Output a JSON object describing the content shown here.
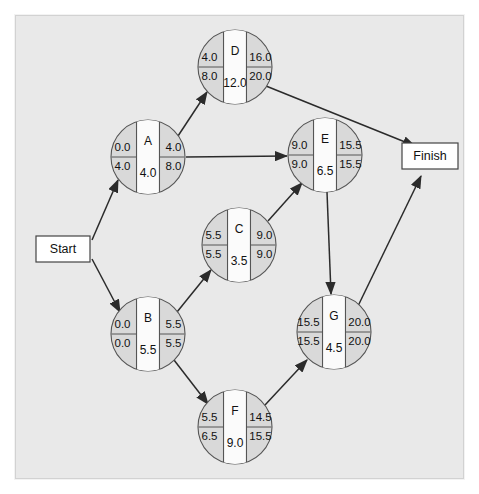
{
  "diagram": {
    "type": "activity-on-node-network",
    "title": "",
    "background_color": "#e9e9e9",
    "node_fill_color": "#d9d9d9",
    "node_band_color": "#fbfbfb",
    "edge_color": "#2b2b2b"
  },
  "terminals": [
    {
      "id": "start",
      "label": "Start",
      "x": 63,
      "y": 249,
      "w": 54,
      "h": 26
    },
    {
      "id": "finish",
      "label": "Finish",
      "x": 430,
      "y": 156,
      "w": 56,
      "h": 26
    }
  ],
  "nodes": [
    {
      "id": "D",
      "label": "D",
      "cx": 235,
      "cy": 67,
      "r": 37,
      "early_start": "4.0",
      "late_start": "8.0",
      "early_finish": "16.0",
      "late_finish": "20.0",
      "duration": "12.0"
    },
    {
      "id": "A",
      "label": "A",
      "cx": 148,
      "cy": 157,
      "r": 37,
      "early_start": "0.0",
      "late_start": "4.0",
      "early_finish": "4.0",
      "late_finish": "8.0",
      "duration": "4.0"
    },
    {
      "id": "E",
      "label": "E",
      "cx": 325,
      "cy": 155,
      "r": 37,
      "early_start": "9.0",
      "late_start": "9.0",
      "early_finish": "15.5",
      "late_finish": "15.5",
      "duration": "6.5"
    },
    {
      "id": "C",
      "label": "C",
      "cx": 239,
      "cy": 245,
      "r": 37,
      "early_start": "5.5",
      "late_start": "5.5",
      "early_finish": "9.0",
      "late_finish": "9.0",
      "duration": "3.5"
    },
    {
      "id": "B",
      "label": "B",
      "cx": 148,
      "cy": 334,
      "r": 37,
      "early_start": "0.0",
      "late_start": "0.0",
      "early_finish": "5.5",
      "late_finish": "5.5",
      "duration": "5.5"
    },
    {
      "id": "G",
      "label": "G",
      "cx": 334,
      "cy": 332,
      "r": 37,
      "early_start": "15.5",
      "late_start": "15.5",
      "early_finish": "20.0",
      "late_finish": "20.0",
      "duration": "4.5"
    },
    {
      "id": "F",
      "label": "F",
      "cx": 235,
      "cy": 427,
      "r": 37,
      "early_start": "5.5",
      "late_start": "6.5",
      "early_finish": "14.5",
      "late_finish": "15.5",
      "duration": "9.0"
    }
  ],
  "edges": [
    {
      "from": "start",
      "to": "A",
      "x1": 92,
      "y1": 240,
      "x2": 118,
      "y2": 180
    },
    {
      "from": "start",
      "to": "B",
      "x1": 92,
      "y1": 259,
      "x2": 120,
      "y2": 312
    },
    {
      "from": "A",
      "to": "D",
      "x1": 178,
      "y1": 136,
      "x2": 207,
      "y2": 92
    },
    {
      "from": "A",
      "to": "E",
      "x1": 186,
      "y1": 157,
      "x2": 287,
      "y2": 156
    },
    {
      "from": "D",
      "to": "finish",
      "x1": 266,
      "y1": 86,
      "x2": 415,
      "y2": 146
    },
    {
      "from": "B",
      "to": "C",
      "x1": 177,
      "y1": 312,
      "x2": 211,
      "y2": 270
    },
    {
      "from": "B",
      "to": "F",
      "x1": 174,
      "y1": 360,
      "x2": 208,
      "y2": 404
    },
    {
      "from": "C",
      "to": "E",
      "x1": 268,
      "y1": 221,
      "x2": 302,
      "y2": 183
    },
    {
      "from": "E",
      "to": "G",
      "x1": 327,
      "y1": 192,
      "x2": 331,
      "y2": 294
    },
    {
      "from": "F",
      "to": "G",
      "x1": 265,
      "y1": 405,
      "x2": 307,
      "y2": 360
    },
    {
      "from": "G",
      "to": "finish",
      "x1": 358,
      "y1": 306,
      "x2": 421,
      "y2": 176
    }
  ],
  "chart_data": {
    "type": "diagram",
    "legend": "Each node shows: ES / LS (left), Activity / Duration (center), EF / LF (right)",
    "activities": [
      {
        "name": "A",
        "duration": 4.0,
        "ES": 0.0,
        "LS": 4.0,
        "EF": 4.0,
        "LF": 8.0,
        "slack": 4.0,
        "critical": false,
        "predecessors": [
          "Start"
        ],
        "successors": [
          "D",
          "E"
        ]
      },
      {
        "name": "B",
        "duration": 5.5,
        "ES": 0.0,
        "LS": 0.0,
        "EF": 5.5,
        "LF": 5.5,
        "slack": 0.0,
        "critical": true,
        "predecessors": [
          "Start"
        ],
        "successors": [
          "C",
          "F"
        ]
      },
      {
        "name": "C",
        "duration": 3.5,
        "ES": 5.5,
        "LS": 5.5,
        "EF": 9.0,
        "LF": 9.0,
        "slack": 0.0,
        "critical": true,
        "predecessors": [
          "B"
        ],
        "successors": [
          "E"
        ]
      },
      {
        "name": "D",
        "duration": 12.0,
        "ES": 4.0,
        "LS": 8.0,
        "EF": 16.0,
        "LF": 20.0,
        "slack": 4.0,
        "critical": false,
        "predecessors": [
          "A"
        ],
        "successors": [
          "Finish"
        ]
      },
      {
        "name": "E",
        "duration": 6.5,
        "ES": 9.0,
        "LS": 9.0,
        "EF": 15.5,
        "LF": 15.5,
        "slack": 0.0,
        "critical": true,
        "predecessors": [
          "A",
          "C"
        ],
        "successors": [
          "G"
        ]
      },
      {
        "name": "F",
        "duration": 9.0,
        "ES": 5.5,
        "LS": 6.5,
        "EF": 14.5,
        "LF": 15.5,
        "slack": 1.0,
        "critical": false,
        "predecessors": [
          "B"
        ],
        "successors": [
          "G"
        ]
      },
      {
        "name": "G",
        "duration": 4.5,
        "ES": 15.5,
        "LS": 15.5,
        "EF": 20.0,
        "LF": 20.0,
        "slack": 0.0,
        "critical": true,
        "predecessors": [
          "E",
          "F"
        ],
        "successors": [
          "Finish"
        ]
      }
    ],
    "project_duration": 20.0,
    "critical_path": [
      "Start",
      "B",
      "C",
      "E",
      "G",
      "Finish"
    ]
  }
}
